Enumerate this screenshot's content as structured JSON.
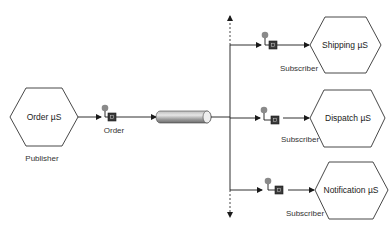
{
  "diagram": {
    "type": "publish-subscribe",
    "publisher": {
      "service_label": "Order µS",
      "role_label": "Publisher",
      "port_label": "Order",
      "port_icon": "queue-port-icon"
    },
    "channel": {
      "icon": "message-channel-cylinder-icon"
    },
    "subscribers": [
      {
        "service_label": "Shipping µS",
        "role_label": "Subscriber",
        "port_icon": "queue-port-icon"
      },
      {
        "service_label": "Dispatch µS",
        "role_label": "Subscriber",
        "port_icon": "queue-port-icon"
      },
      {
        "service_label": "Notification µS",
        "role_label": "Subscriber",
        "port_icon": "queue-port-icon"
      }
    ],
    "colors": {
      "line": "#1a1a1a",
      "hexagon_stroke": "#333333",
      "port_dot": "#8a8a8a",
      "port_square": "#3a3a3a",
      "cylinder_dark": "#7d7d7d",
      "cylinder_light": "#e0e0e0"
    }
  }
}
